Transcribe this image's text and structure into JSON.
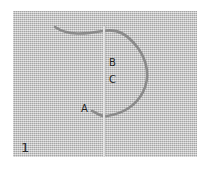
{
  "figure": {
    "step_number": "1",
    "labels": {
      "a": "A",
      "b": "B",
      "c": "C"
    },
    "colors": {
      "fabric": "#c9c9c9",
      "thread": "#8a8a8a",
      "needle": "#e6e6e6"
    }
  }
}
